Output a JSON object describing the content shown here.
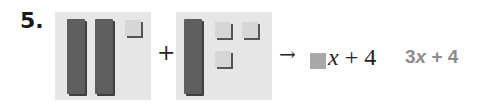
{
  "problem": {
    "number": "5.",
    "left_model": {
      "x_tiles": 2,
      "unit_tiles": 1
    },
    "right_model": {
      "x_tiles": 1,
      "unit_tiles": 3
    },
    "plus_symbol": "+",
    "arrow_symbol": "→",
    "expression": {
      "variable": "x",
      "rest": " + 4"
    },
    "answer": {
      "coefficient": "3",
      "variable": "x",
      "rest": " + 4"
    }
  },
  "colors": {
    "tile_background": "#e6e6e6",
    "x_tile": "#5e5e5e",
    "unit_tile": "#d6d6d6",
    "blank_box": "#a8a8a8",
    "answer_text": "#8c8c8c"
  }
}
